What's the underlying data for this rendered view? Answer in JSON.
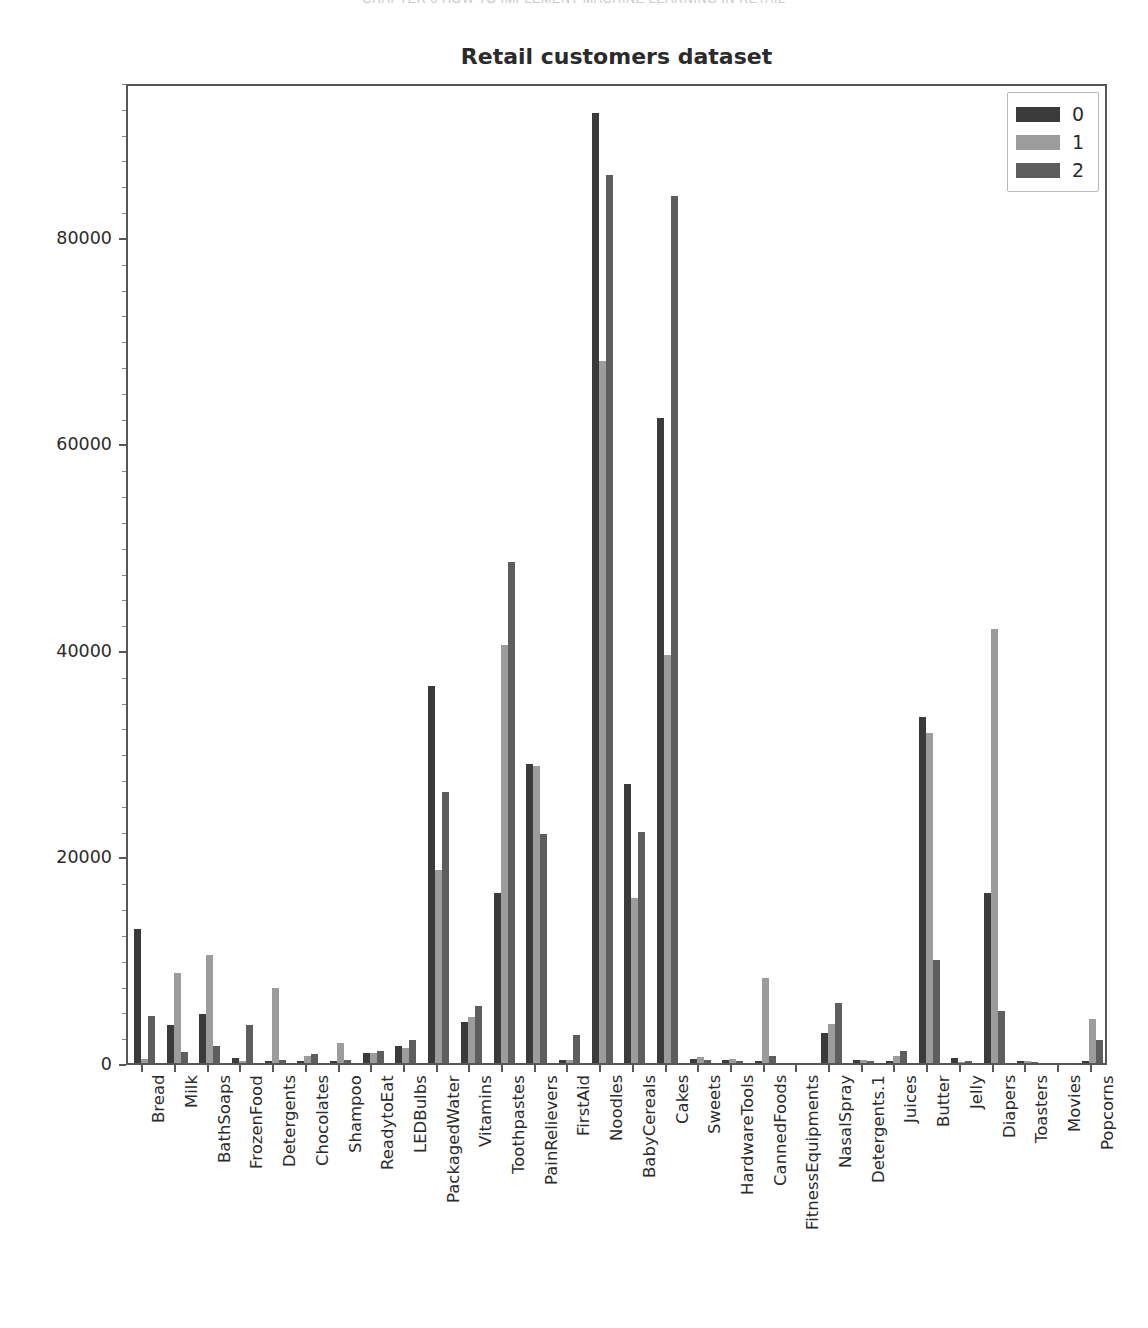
{
  "running_header": "CHAPTER 6    HOW TO IMPLEMENT MACHINE LEARNING IN RETAIL",
  "chart_data": {
    "type": "bar",
    "title": "Retail customers dataset",
    "xlabel": "",
    "ylabel": "",
    "ylim": [
      0,
      95000
    ],
    "yticks": [
      0,
      20000,
      40000,
      60000,
      80000
    ],
    "ytick_labels": [
      "0",
      "20000",
      "40000",
      "60000",
      "80000"
    ],
    "grid": false,
    "legend_position": "upper right",
    "legend_title": "",
    "colors": {
      "series0": "#3b3b3b",
      "series1": "#9c9c9c",
      "series2": "#5e5e5e",
      "axis": "#575757",
      "text": "#2b2b2b",
      "background": "#ffffff"
    },
    "categories": [
      "Bread",
      "Milk",
      "BathSoaps",
      "FrozenFood",
      "Detergents",
      "Chocolates",
      "Shampoo",
      "ReadytoEat",
      "LEDBulbs",
      "PackagedWater",
      "Vitamins",
      "Toothpastes",
      "PainRelievers",
      "FirstAid",
      "Noodles",
      "BabyCereals",
      "Cakes",
      "Sweets",
      "HardwareTools",
      "CannedFoods",
      "FitnessEquipments",
      "NasalSpray",
      "Detergents.1",
      "Juices",
      "Butter",
      "Jelly",
      "Diapers",
      "Toasters",
      "Movies",
      "Popcorns"
    ],
    "series": [
      {
        "name": "0",
        "color": "#3b3b3b",
        "values": [
          13000,
          3700,
          4700,
          500,
          200,
          200,
          200,
          1000,
          1600,
          36500,
          4000,
          16500,
          29000,
          300,
          92000,
          27000,
          62500,
          400,
          300,
          200,
          0,
          2900,
          300,
          200,
          33500,
          500,
          16500,
          200,
          0,
          200
        ]
      },
      {
        "name": "1",
        "color": "#9c9c9c",
        "values": [
          400,
          8700,
          10500,
          200,
          7300,
          700,
          1900,
          1000,
          1500,
          18700,
          4500,
          40500,
          28800,
          300,
          68000,
          16000,
          39500,
          600,
          400,
          8200,
          0,
          3800,
          300,
          700,
          32000,
          100,
          42000,
          200,
          0,
          4300
        ]
      },
      {
        "name": "2",
        "color": "#5e5e5e",
        "values": [
          4600,
          1100,
          1600,
          3700,
          300,
          900,
          300,
          1200,
          2200,
          26200,
          5500,
          48500,
          22200,
          2700,
          86000,
          22400,
          84000,
          300,
          200,
          700,
          0,
          5800,
          200,
          1200,
          10000,
          200,
          5000,
          100,
          0,
          2200
        ]
      }
    ]
  },
  "legend": {
    "items": [
      {
        "label": "0",
        "color": "#3b3b3b"
      },
      {
        "label": "1",
        "color": "#9c9c9c"
      },
      {
        "label": "2",
        "color": "#5e5e5e"
      }
    ]
  }
}
